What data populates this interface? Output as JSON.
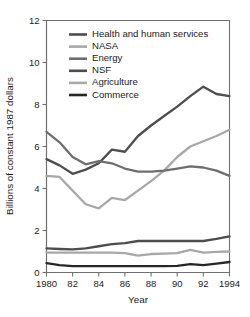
{
  "chart_data": {
    "type": "line",
    "title": "",
    "xlabel": "Year",
    "ylabel": "Billions of constant 1987 dollars",
    "xlim": [
      1980,
      1994
    ],
    "ylim": [
      0,
      12
    ],
    "grid": false,
    "legend_position": "top-left inside plot",
    "x_tick_labels": [
      "1980",
      "82",
      "84",
      "86",
      "88",
      "90",
      "92",
      "1994"
    ],
    "x_tick_values": [
      1980,
      1982,
      1984,
      1986,
      1988,
      1990,
      1992,
      1994
    ],
    "y_tick_labels": [
      "0",
      "2",
      "4",
      "6",
      "8",
      "10",
      "12"
    ],
    "y_tick_values": [
      0,
      2,
      4,
      6,
      8,
      10,
      12
    ],
    "x": [
      1980,
      1981,
      1982,
      1983,
      1984,
      1985,
      1986,
      1987,
      1988,
      1989,
      1990,
      1991,
      1992,
      1993,
      1994
    ],
    "series": [
      {
        "name": "Health and human services",
        "color": "#4d4d4d",
        "width": 2.3,
        "values": [
          5.4,
          5.1,
          4.7,
          4.9,
          5.2,
          5.85,
          5.75,
          6.5,
          7.0,
          7.45,
          7.9,
          8.4,
          8.85,
          8.5,
          8.4
        ]
      },
      {
        "name": "NASA",
        "color": "#a8a8a8",
        "width": 2.3,
        "values": [
          4.6,
          4.55,
          3.9,
          3.25,
          3.05,
          3.55,
          3.45,
          3.9,
          4.35,
          4.85,
          5.5,
          6.0,
          6.25,
          6.5,
          6.8
        ]
      },
      {
        "name": "Energy",
        "color": "#6e6e6e",
        "width": 2.3,
        "values": [
          6.7,
          6.2,
          5.5,
          5.15,
          5.3,
          5.2,
          4.95,
          4.8,
          4.8,
          4.85,
          4.95,
          5.05,
          5.0,
          4.85,
          4.6
        ]
      },
      {
        "name": "NSF",
        "color": "#4d4d4d",
        "width": 2.3,
        "values": [
          1.15,
          1.12,
          1.1,
          1.15,
          1.25,
          1.35,
          1.4,
          1.5,
          1.5,
          1.5,
          1.5,
          1.5,
          1.5,
          1.6,
          1.72
        ]
      },
      {
        "name": "Agriculture",
        "color": "#a8a8a8",
        "width": 2.3,
        "values": [
          0.95,
          0.95,
          0.95,
          0.95,
          0.95,
          0.95,
          0.92,
          0.8,
          0.88,
          0.9,
          0.92,
          1.08,
          0.95,
          0.98,
          1.0
        ]
      },
      {
        "name": "Commerce",
        "color": "#262626",
        "width": 2.3,
        "values": [
          0.45,
          0.35,
          0.3,
          0.3,
          0.3,
          0.3,
          0.3,
          0.3,
          0.3,
          0.3,
          0.32,
          0.4,
          0.35,
          0.42,
          0.5
        ]
      }
    ]
  },
  "legend": {
    "entries": [
      {
        "label": "Health and human services",
        "color": "#4d4d4d"
      },
      {
        "label": "NASA",
        "color": "#a8a8a8"
      },
      {
        "label": "Energy",
        "color": "#6e6e6e"
      },
      {
        "label": "NSF",
        "color": "#4d4d4d"
      },
      {
        "label": "Agriculture",
        "color": "#a8a8a8"
      },
      {
        "label": "Commerce",
        "color": "#262626"
      }
    ]
  },
  "axes": {
    "x_title": "Year",
    "y_title": "Billions of constant 1987 dollars"
  }
}
